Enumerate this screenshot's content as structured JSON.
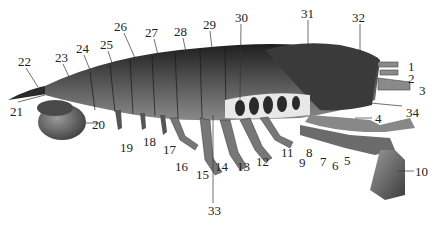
{
  "figure": {
    "type": "anatomical-illustration",
    "colors": {
      "body_dark": "#2b2b2b",
      "body_mid": "#6b6b6b",
      "body_light": "#bdbdbd",
      "leader": "#333333",
      "background": "#ffffff"
    }
  },
  "labels": [
    {
      "n": "1",
      "x": 408,
      "y": 60
    },
    {
      "n": "2",
      "x": 408,
      "y": 72
    },
    {
      "n": "3",
      "x": 419,
      "y": 84
    },
    {
      "n": "4",
      "x": 375,
      "y": 112
    },
    {
      "n": "5",
      "x": 344,
      "y": 154
    },
    {
      "n": "6",
      "x": 332,
      "y": 159
    },
    {
      "n": "7",
      "x": 320,
      "y": 155
    },
    {
      "n": "8",
      "x": 306,
      "y": 146
    },
    {
      "n": "9",
      "x": 299,
      "y": 156
    },
    {
      "n": "10",
      "x": 415,
      "y": 165
    },
    {
      "n": "11",
      "x": 281,
      "y": 146
    },
    {
      "n": "12",
      "x": 256,
      "y": 155
    },
    {
      "n": "13",
      "x": 237,
      "y": 160
    },
    {
      "n": "14",
      "x": 215,
      "y": 160
    },
    {
      "n": "15",
      "x": 196,
      "y": 168
    },
    {
      "n": "16",
      "x": 175,
      "y": 160
    },
    {
      "n": "17",
      "x": 163,
      "y": 143
    },
    {
      "n": "18",
      "x": 143,
      "y": 135
    },
    {
      "n": "19",
      "x": 120,
      "y": 141
    },
    {
      "n": "20",
      "x": 92,
      "y": 118
    },
    {
      "n": "21",
      "x": 10,
      "y": 105
    },
    {
      "n": "22",
      "x": 18,
      "y": 55
    },
    {
      "n": "23",
      "x": 55,
      "y": 51
    },
    {
      "n": "24",
      "x": 76,
      "y": 42
    },
    {
      "n": "25",
      "x": 100,
      "y": 38
    },
    {
      "n": "26",
      "x": 114,
      "y": 20
    },
    {
      "n": "27",
      "x": 145,
      "y": 26
    },
    {
      "n": "28",
      "x": 174,
      "y": 25
    },
    {
      "n": "29",
      "x": 203,
      "y": 18
    },
    {
      "n": "30",
      "x": 235,
      "y": 11
    },
    {
      "n": "31",
      "x": 301,
      "y": 7
    },
    {
      "n": "32",
      "x": 352,
      "y": 11
    },
    {
      "n": "33",
      "x": 208,
      "y": 204
    },
    {
      "n": "34",
      "x": 406,
      "y": 106
    }
  ]
}
